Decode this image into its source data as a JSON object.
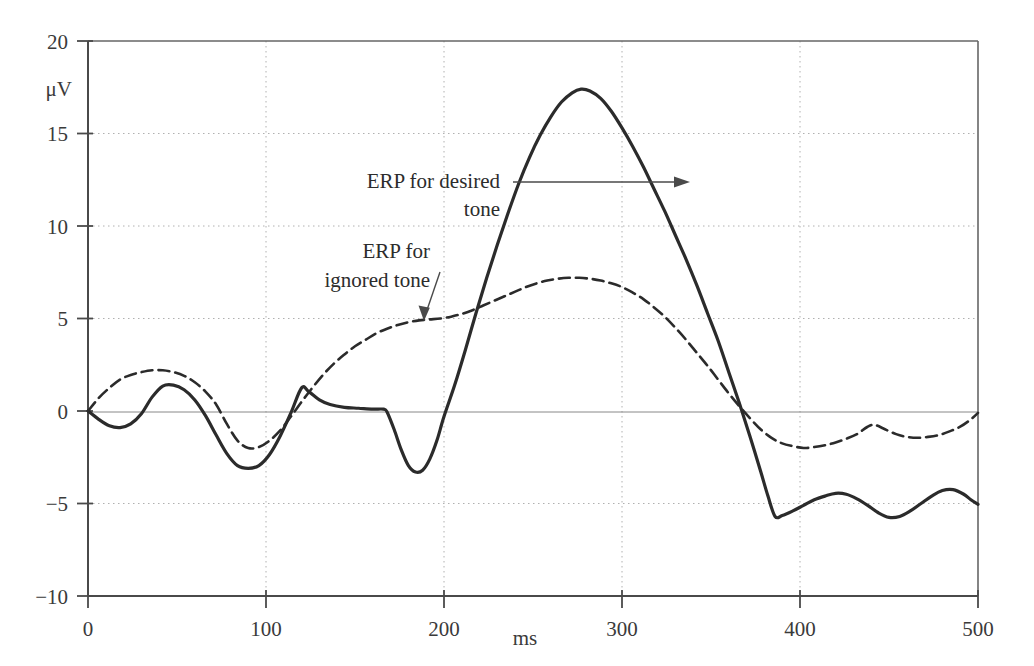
{
  "chart_data": {
    "type": "line",
    "title": "",
    "subtitle": "",
    "xlabel": "ms",
    "ylabel": "μV",
    "xlim": [
      0,
      500
    ],
    "ylim": [
      -10,
      20
    ],
    "xticks": [
      0,
      100,
      200,
      300,
      400,
      500
    ],
    "xtick_labels": [
      "0",
      "100",
      "200",
      "300",
      "400",
      "500"
    ],
    "yticks": [
      -10,
      -5,
      0,
      5,
      10,
      15,
      20
    ],
    "ytick_labels": [
      "−10",
      "−5",
      "0",
      "5",
      "10",
      "15",
      "20"
    ],
    "grid": true,
    "grid_style": "dotted",
    "legend_position": "inline-annotations",
    "series": [
      {
        "name": "ERP for desired tone",
        "style": "solid",
        "color": "#2b2b2b",
        "width": 3.2,
        "points": [
          [
            0,
            0.0
          ],
          [
            6,
            -0.45
          ],
          [
            12,
            -0.8
          ],
          [
            18,
            -0.9
          ],
          [
            24,
            -0.7
          ],
          [
            30,
            -0.15
          ],
          [
            36,
            0.75
          ],
          [
            42,
            1.35
          ],
          [
            48,
            1.4
          ],
          [
            54,
            1.15
          ],
          [
            60,
            0.6
          ],
          [
            66,
            -0.25
          ],
          [
            72,
            -1.3
          ],
          [
            78,
            -2.3
          ],
          [
            84,
            -2.95
          ],
          [
            90,
            -3.1
          ],
          [
            96,
            -2.95
          ],
          [
            102,
            -2.35
          ],
          [
            108,
            -1.35
          ],
          [
            114,
            -0.1
          ],
          [
            120,
            1.25
          ],
          [
            124,
            1.05
          ],
          [
            130,
            0.6
          ],
          [
            136,
            0.35
          ],
          [
            144,
            0.2
          ],
          [
            152,
            0.15
          ],
          [
            160,
            0.1
          ],
          [
            166,
            0.1
          ],
          [
            168,
            -0.05
          ],
          [
            172,
            -1.0
          ],
          [
            176,
            -2.1
          ],
          [
            180,
            -2.95
          ],
          [
            184,
            -3.3
          ],
          [
            188,
            -3.2
          ],
          [
            192,
            -2.6
          ],
          [
            196,
            -1.6
          ],
          [
            200,
            -0.3
          ],
          [
            206,
            1.4
          ],
          [
            212,
            3.3
          ],
          [
            218,
            5.3
          ],
          [
            224,
            7.2
          ],
          [
            230,
            9.0
          ],
          [
            236,
            10.7
          ],
          [
            242,
            12.3
          ],
          [
            248,
            13.7
          ],
          [
            254,
            14.9
          ],
          [
            260,
            15.9
          ],
          [
            266,
            16.7
          ],
          [
            272,
            17.2
          ],
          [
            277,
            17.4
          ],
          [
            282,
            17.3
          ],
          [
            288,
            16.9
          ],
          [
            294,
            16.2
          ],
          [
            300,
            15.3
          ],
          [
            306,
            14.3
          ],
          [
            312,
            13.2
          ],
          [
            318,
            12.0
          ],
          [
            324,
            10.8
          ],
          [
            330,
            9.5
          ],
          [
            336,
            8.2
          ],
          [
            342,
            6.8
          ],
          [
            348,
            5.3
          ],
          [
            354,
            3.8
          ],
          [
            360,
            2.1
          ],
          [
            366,
            0.4
          ],
          [
            372,
            -1.4
          ],
          [
            378,
            -3.3
          ],
          [
            382,
            -4.6
          ],
          [
            386,
            -5.7
          ],
          [
            390,
            -5.65
          ],
          [
            396,
            -5.4
          ],
          [
            402,
            -5.1
          ],
          [
            408,
            -4.8
          ],
          [
            414,
            -4.6
          ],
          [
            420,
            -4.45
          ],
          [
            426,
            -4.5
          ],
          [
            432,
            -4.75
          ],
          [
            438,
            -5.1
          ],
          [
            444,
            -5.5
          ],
          [
            450,
            -5.75
          ],
          [
            456,
            -5.7
          ],
          [
            462,
            -5.4
          ],
          [
            468,
            -5.0
          ],
          [
            474,
            -4.6
          ],
          [
            480,
            -4.3
          ],
          [
            486,
            -4.25
          ],
          [
            492,
            -4.5
          ],
          [
            496,
            -4.8
          ],
          [
            500,
            -5.05
          ]
        ]
      },
      {
        "name": "ERP for ignored tone",
        "style": "dashed",
        "color": "#2b2b2b",
        "width": 2.6,
        "points": [
          [
            0,
            0.0
          ],
          [
            6,
            0.7
          ],
          [
            12,
            1.25
          ],
          [
            18,
            1.7
          ],
          [
            24,
            1.95
          ],
          [
            30,
            2.1
          ],
          [
            36,
            2.2
          ],
          [
            42,
            2.2
          ],
          [
            48,
            2.1
          ],
          [
            54,
            1.9
          ],
          [
            60,
            1.55
          ],
          [
            66,
            1.05
          ],
          [
            72,
            0.35
          ],
          [
            78,
            -0.7
          ],
          [
            84,
            -1.6
          ],
          [
            90,
            -2.0
          ],
          [
            96,
            -1.95
          ],
          [
            102,
            -1.6
          ],
          [
            108,
            -1.05
          ],
          [
            114,
            -0.3
          ],
          [
            120,
            0.5
          ],
          [
            126,
            1.25
          ],
          [
            132,
            1.95
          ],
          [
            138,
            2.55
          ],
          [
            144,
            3.05
          ],
          [
            150,
            3.5
          ],
          [
            156,
            3.85
          ],
          [
            162,
            4.2
          ],
          [
            168,
            4.45
          ],
          [
            174,
            4.65
          ],
          [
            180,
            4.8
          ],
          [
            186,
            4.9
          ],
          [
            192,
            4.95
          ],
          [
            198,
            5.0
          ],
          [
            204,
            5.1
          ],
          [
            210,
            5.25
          ],
          [
            216,
            5.45
          ],
          [
            222,
            5.7
          ],
          [
            228,
            5.95
          ],
          [
            234,
            6.2
          ],
          [
            240,
            6.45
          ],
          [
            246,
            6.7
          ],
          [
            252,
            6.9
          ],
          [
            258,
            7.05
          ],
          [
            264,
            7.15
          ],
          [
            270,
            7.2
          ],
          [
            276,
            7.2
          ],
          [
            282,
            7.15
          ],
          [
            288,
            7.05
          ],
          [
            294,
            6.9
          ],
          [
            300,
            6.7
          ],
          [
            306,
            6.4
          ],
          [
            312,
            6.05
          ],
          [
            318,
            5.6
          ],
          [
            324,
            5.1
          ],
          [
            330,
            4.5
          ],
          [
            336,
            3.85
          ],
          [
            342,
            3.15
          ],
          [
            348,
            2.45
          ],
          [
            354,
            1.7
          ],
          [
            360,
            0.95
          ],
          [
            366,
            0.25
          ],
          [
            372,
            -0.4
          ],
          [
            378,
            -1.0
          ],
          [
            384,
            -1.45
          ],
          [
            390,
            -1.75
          ],
          [
            396,
            -1.9
          ],
          [
            402,
            -2.0
          ],
          [
            408,
            -1.95
          ],
          [
            414,
            -1.85
          ],
          [
            420,
            -1.7
          ],
          [
            426,
            -1.5
          ],
          [
            432,
            -1.25
          ],
          [
            438,
            -0.85
          ],
          [
            442,
            -0.75
          ],
          [
            448,
            -1.0
          ],
          [
            454,
            -1.25
          ],
          [
            460,
            -1.4
          ],
          [
            466,
            -1.45
          ],
          [
            472,
            -1.4
          ],
          [
            478,
            -1.3
          ],
          [
            484,
            -1.1
          ],
          [
            490,
            -0.85
          ],
          [
            496,
            -0.45
          ],
          [
            500,
            -0.1
          ]
        ]
      }
    ],
    "annotations": [
      {
        "id": "desired-tone-annotation",
        "text_line1": "ERP for desired",
        "text_line2": "tone",
        "arrow": "horizontal-right",
        "points_to_series": "ERP for desired tone",
        "target_x": 243,
        "target_y": 12.7
      },
      {
        "id": "ignored-tone-annotation",
        "text_line1": "ERP for",
        "text_line2": "ignored tone",
        "arrow": "diagonal-down-right",
        "points_to_series": "ERP for ignored tone",
        "target_x": 195,
        "target_y": 4.95
      }
    ]
  },
  "colors": {
    "axis": "#555555",
    "grid": "#b0b0b0",
    "curve": "#2b2b2b",
    "text": "#2c2c2c",
    "background": "#ffffff"
  }
}
